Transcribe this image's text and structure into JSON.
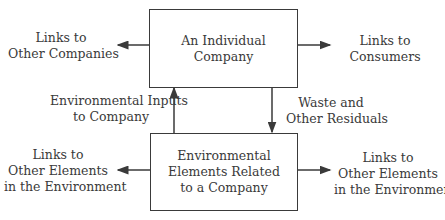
{
  "diagram": {
    "top_box": {
      "lines": [
        "An Individual",
        "Company"
      ]
    },
    "bottom_box": {
      "lines": [
        "Environmental",
        "Elements Related",
        "to a Company"
      ]
    },
    "labels": {
      "links_other_companies": [
        "Links to",
        "Other Companies"
      ],
      "links_consumers": [
        "Links to",
        "Consumers"
      ],
      "env_inputs": [
        "Environmental Inputs",
        "to Company"
      ],
      "waste": [
        "Waste and",
        "Other Residuals"
      ],
      "links_env_left": [
        "Links to",
        "Other Elements",
        "in the Environment"
      ],
      "links_env_right": [
        "Links to",
        "Other Elements",
        "in the Environment"
      ]
    },
    "colors": {
      "stroke": "#3a3a3a",
      "background": "#ffffff"
    }
  }
}
